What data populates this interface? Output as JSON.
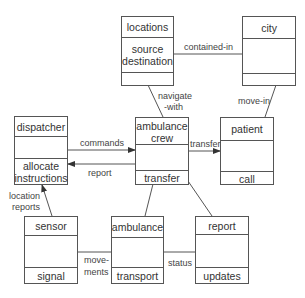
{
  "diagram": {
    "type": "class-diagram",
    "line_color": "#555555",
    "text_color": "#333333",
    "classes": [
      {
        "id": "locations",
        "name": "locations",
        "attributes": "source destination",
        "operations": ""
      },
      {
        "id": "city",
        "name": "city",
        "attributes": "",
        "operations": ""
      },
      {
        "id": "dispatcher",
        "name": "dispatcher",
        "attributes": "",
        "operations": "allocate instructions"
      },
      {
        "id": "ambulance_crew",
        "name": "ambulance crew",
        "attributes": "",
        "operations": "transfer"
      },
      {
        "id": "patient",
        "name": "patient",
        "attributes": "",
        "operations": "call"
      },
      {
        "id": "sensor",
        "name": "sensor",
        "attributes": "",
        "operations": "signal"
      },
      {
        "id": "ambulance",
        "name": "ambulance",
        "attributes": "",
        "operations": "transport"
      },
      {
        "id": "report",
        "name": "report",
        "attributes": "",
        "operations": "updates"
      }
    ],
    "relations": [
      {
        "from": "locations",
        "to": "city",
        "label": "contained-in",
        "arrow": false
      },
      {
        "from": "locations",
        "to": "ambulance_crew",
        "label": "navigate -with",
        "arrow": false
      },
      {
        "from": "city",
        "to": "patient",
        "label": "move-in",
        "arrow": false
      },
      {
        "from": "dispatcher",
        "to": "ambulance_crew",
        "label": "commands",
        "arrow": true
      },
      {
        "from": "ambulance_crew",
        "to": "dispatcher",
        "label": "report",
        "arrow": true
      },
      {
        "from": "ambulance_crew",
        "to": "patient",
        "label": "transfer",
        "arrow": true
      },
      {
        "from": "sensor",
        "to": "dispatcher",
        "label": "location reports",
        "arrow": true
      },
      {
        "from": "ambulance_crew",
        "to": "ambulance",
        "label": "",
        "arrow": false
      },
      {
        "from": "ambulance_crew",
        "to": "report",
        "label": "",
        "arrow": false
      },
      {
        "from": "sensor",
        "to": "ambulance",
        "label": "move- ments",
        "arrow": false
      },
      {
        "from": "ambulance",
        "to": "report",
        "label": "status",
        "arrow": false
      }
    ]
  },
  "labels": {
    "locations_name": "locations",
    "locations_attr1": "source",
    "locations_attr2": "destination",
    "city_name": "city",
    "dispatcher_name": "dispatcher",
    "dispatcher_op1": "allocate",
    "dispatcher_op2": "instructions",
    "crew_name1": "ambulance",
    "crew_name2": "crew",
    "crew_op": "transfer",
    "patient_name": "patient",
    "patient_op": "call",
    "sensor_name": "sensor",
    "sensor_op": "signal",
    "ambulance_name": "ambulance",
    "ambulance_op": "transport",
    "report_name": "report",
    "report_op": "updates",
    "rel_contained_in": "contained-in",
    "rel_navigate1": "navigate",
    "rel_navigate2": "-with",
    "rel_move_in": "move-in",
    "rel_commands": "commands",
    "rel_report": "report",
    "rel_transfer": "transfer",
    "rel_location1": "location",
    "rel_location2": "reports",
    "rel_movements1": "move-",
    "rel_movements2": "ments",
    "rel_status": "status"
  }
}
